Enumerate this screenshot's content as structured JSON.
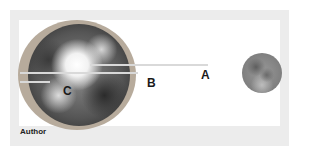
{
  "diagram": {
    "labels": {
      "a": "A",
      "b": "B",
      "c": "C"
    },
    "credit": "Author",
    "objects": {
      "earth": "earth-with-atmosphere",
      "moon": "full-moon"
    },
    "colors": {
      "frame": "#ececec",
      "panel": "#ffffff",
      "atmosphere": "#b7ab9c",
      "line": "#d9d9d9",
      "label": "#1a1a1a"
    }
  }
}
